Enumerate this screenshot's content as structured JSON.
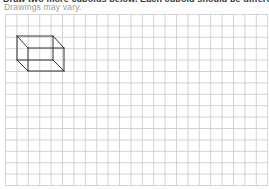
{
  "instruction": "Draw two more cuboids below. Each cuboid should be different.",
  "note": "Drawings may vary.",
  "grid": {
    "left": 5.5,
    "top": 14.5,
    "columns": 23,
    "rows": 15,
    "cell": 11.4,
    "line_color": "#c8c8c8"
  },
  "cuboid": {
    "label": "example-cuboid",
    "stroke": "#333333",
    "vertices": {
      "back_top_left": [
        17,
        36
      ],
      "back_top_right": [
        53,
        36
      ],
      "back_bottom_left": [
        17,
        60
      ],
      "back_bottom_right": [
        53,
        60
      ],
      "front_top_left": [
        28,
        48
      ],
      "front_top_right": [
        64,
        48
      ],
      "front_bottom_left": [
        28,
        71
      ],
      "front_bottom_right": [
        64,
        71
      ]
    }
  }
}
